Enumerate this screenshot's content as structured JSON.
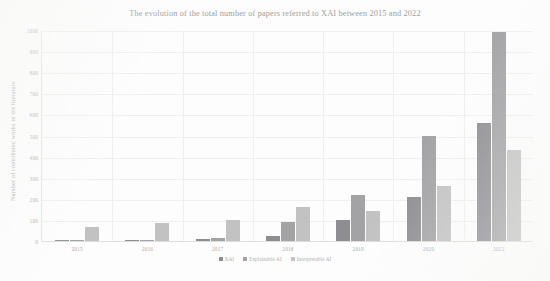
{
  "chart_data": {
    "type": "bar",
    "title": "The evolution of the total number of papers referred to XAI between 2015 and 2022",
    "xlabel": "",
    "ylabel": "Number of contributed works in the literature",
    "categories": [
      "2015",
      "2016",
      "2017",
      "2018",
      "2019",
      "2020",
      "2022"
    ],
    "series": [
      {
        "name": "XAI",
        "color": "#8d8d93",
        "values": [
          5,
          6,
          10,
          25,
          100,
          210,
          560
        ]
      },
      {
        "name": "Explainable AI",
        "color": "#a3a3a6",
        "values": [
          2,
          3,
          12,
          90,
          220,
          500,
          990
        ]
      },
      {
        "name": "Interpretable AI",
        "color": "#c2c2c2",
        "values": [
          65,
          85,
          100,
          160,
          140,
          260,
          430
        ]
      }
    ],
    "ylim": [
      0,
      1000
    ],
    "yticks": [
      "0",
      "100",
      "200",
      "300",
      "400",
      "500",
      "600",
      "700",
      "800",
      "900",
      "1000"
    ],
    "ytick_values": [
      0,
      100,
      200,
      300,
      400,
      500,
      600,
      700,
      800,
      900,
      1000
    ],
    "grid": true,
    "legend_position": "bottom"
  }
}
